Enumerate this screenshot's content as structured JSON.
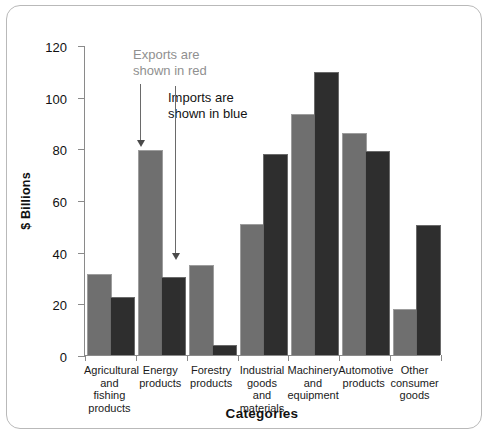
{
  "chart_data": {
    "type": "bar",
    "title": "",
    "xlabel": "Categories",
    "ylabel": "$ Billions",
    "ylim": [
      0,
      120
    ],
    "ytick_step": 20,
    "yticks": [
      0,
      20,
      40,
      60,
      80,
      100,
      120
    ],
    "grid": false,
    "legend_position": "annotations",
    "categories": [
      "Agricultural and fishing products",
      "Energy products",
      "Forestry products",
      "Industrial goods and materials",
      "Machinery and equipment",
      "Automotive products",
      "Other consumer goods"
    ],
    "category_label_lines": [
      [
        "Agricultural",
        "and fishing",
        "products"
      ],
      [
        "Energy",
        "products"
      ],
      [
        "Forestry",
        "products"
      ],
      [
        "Industrial",
        "goods and",
        "materials"
      ],
      [
        "Machinery",
        "and",
        "equipment"
      ],
      [
        "Automotive",
        "products"
      ],
      [
        "Other",
        "consumer",
        "goods"
      ]
    ],
    "series": [
      {
        "name": "Exports",
        "color": "#6f6f6f",
        "values": [
          31,
          79,
          34.5,
          50.5,
          93,
          85.5,
          17.5
        ]
      },
      {
        "name": "Imports",
        "color": "#2e2e2e",
        "values": [
          22,
          30,
          3.5,
          77.5,
          109,
          78.5,
          50
        ]
      }
    ],
    "annotations": [
      {
        "id": "exports-note",
        "text": "Exports are\nshown in red",
        "color": "#909090",
        "points_to": "Energy products exports bar"
      },
      {
        "id": "imports-note",
        "text": "Imports are\nshown in blue",
        "color": "#131313",
        "points_to": "Energy products imports bar"
      }
    ]
  },
  "axis": {
    "y_tick_labels": [
      "120",
      "100",
      "80",
      "60",
      "40",
      "20",
      "0"
    ],
    "y_title": "$ Billions",
    "x_title": "Categories"
  }
}
